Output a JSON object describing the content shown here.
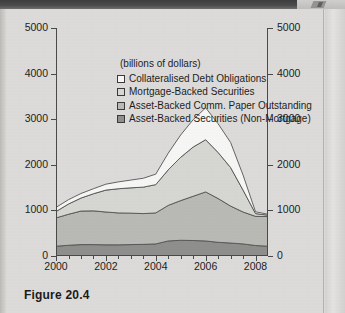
{
  "figure": {
    "caption": "Figure 20.4"
  },
  "chart_data": {
    "type": "area",
    "stacked": true,
    "title": "",
    "subtitle": "",
    "units_note": "(billions of dollars)",
    "xlabel": "",
    "ylabel": "",
    "ylim": [
      0,
      5000
    ],
    "xlim": [
      2000,
      2008.5
    ],
    "grid": false,
    "legend_position": "inside-top-left",
    "y_ticks": [
      0,
      1000,
      2000,
      3000,
      4000,
      5000
    ],
    "y_tick_labels_left": [
      "0",
      "1000",
      "2000",
      "3000",
      "4000",
      "5000"
    ],
    "y_tick_labels_right": [
      "0",
      "1000",
      "2000",
      "3000",
      "4000",
      "5000"
    ],
    "x_ticks_major": [
      2000,
      2002,
      2004,
      2006,
      2008
    ],
    "x_tick_labels": [
      "2000",
      "2002",
      "2004",
      "2006",
      "2008"
    ],
    "x_ticks_minor": [
      2000.5,
      2001,
      2001.5,
      2002.5,
      2003,
      2003.5,
      2004.5,
      2005,
      2005.5,
      2006.5,
      2007,
      2007.5
    ],
    "x": [
      2000,
      2000.5,
      2001,
      2001.5,
      2002,
      2002.5,
      2003,
      2003.5,
      2004,
      2004.5,
      2005,
      2005.5,
      2006,
      2006.5,
      2007,
      2007.5,
      2008,
      2008.5
    ],
    "series": [
      {
        "name": "Asset-Backed Securities (Non-Mortgage)",
        "color": "#8f8f8d",
        "stack_order": 1,
        "values": [
          215,
          235,
          250,
          250,
          245,
          245,
          250,
          255,
          265,
          330,
          345,
          340,
          330,
          300,
          285,
          265,
          230,
          215
        ]
      },
      {
        "name": "Asset-Backed Comm. Paper Outstanding",
        "color": "#b9b9b6",
        "stack_order": 2,
        "values": [
          620,
          680,
          735,
          740,
          720,
          700,
          690,
          675,
          680,
          780,
          870,
          970,
          1075,
          960,
          810,
          700,
          640,
          650
        ]
      },
      {
        "name": "Mortgage-Backed Securities",
        "color": "#d6d6d3",
        "stack_order": 3,
        "values": [
          140,
          225,
          285,
          375,
          480,
          530,
          555,
          580,
          620,
          780,
          950,
          1080,
          1145,
          1010,
          845,
          480,
          60,
          30
        ]
      },
      {
        "name": "Collateralised Debt Obligations",
        "color": "#f6f6f4",
        "stack_order": 4,
        "values": [
          90,
          95,
          100,
          110,
          130,
          150,
          170,
          195,
          230,
          365,
          490,
          600,
          700,
          630,
          550,
          330,
          40,
          20
        ]
      }
    ],
    "cumulative_top": [
      1065,
      1235,
      1370,
      1475,
      1575,
      1625,
      1665,
      1705,
      1795,
      2255,
      2655,
      2990,
      3250,
      2900,
      2490,
      1775,
      970,
      915
    ],
    "annotations": [],
    "peak_year": 2006,
    "peak_total": 3250
  },
  "legend": {
    "units": "(billions of dollars)",
    "items": [
      {
        "label": "Collateralised Debt Obligations",
        "color": "#f6f6f4"
      },
      {
        "label": "Mortgage-Backed Securities",
        "color": "#d6d6d3"
      },
      {
        "label": "Asset-Backed Comm. Paper Outstanding",
        "color": "#b9b9b6"
      },
      {
        "label": "Asset-Backed Securities (Non-Mortgage)",
        "color": "#8f8f8d"
      }
    ]
  }
}
